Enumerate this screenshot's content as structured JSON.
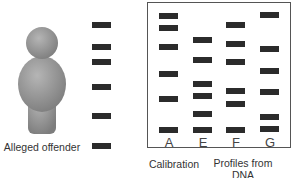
{
  "figure": {
    "offender_label": "Alleged offender",
    "calibration_label": "Calibration",
    "database_label_line1": "Profiles from",
    "database_label_line2": "DNA database",
    "band_color": "#2b2b2b",
    "figure_color": "#9a9a9a"
  },
  "lanes": [
    {
      "id": "offender",
      "label": "",
      "x": 92,
      "bands_y": [
        22,
        44,
        59,
        87,
        114,
        145
      ]
    },
    {
      "id": "A",
      "label": "A",
      "x": 158,
      "bands_y": [
        14,
        26,
        46,
        72,
        97,
        129
      ]
    },
    {
      "id": "E",
      "label": "E",
      "x": 193,
      "bands_y": [
        38,
        58,
        82,
        95,
        113,
        129
      ]
    },
    {
      "id": "F",
      "label": "F",
      "x": 226,
      "bands_y": [
        23,
        43,
        60,
        89,
        102,
        129
      ]
    },
    {
      "id": "G",
      "label": "G",
      "x": 260,
      "bands_y": [
        14,
        47,
        70,
        91,
        116,
        128
      ]
    }
  ]
}
